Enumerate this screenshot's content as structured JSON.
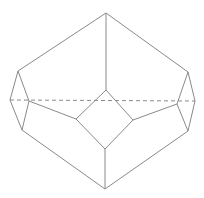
{
  "diagram": {
    "title": "",
    "colors": {
      "stroke": "#8a8a8a",
      "background": "#ffffff"
    },
    "vertices": {
      "top": [
        106,
        13
      ],
      "upper_left": [
        18,
        71
      ],
      "upper_right": [
        188,
        72
      ],
      "far_left": [
        10,
        100
      ],
      "far_right": [
        195,
        101
      ],
      "inner_left": [
        29,
        101
      ],
      "inner_right": [
        177,
        104
      ],
      "lower_left": [
        22,
        130
      ],
      "lower_right": [
        188,
        131
      ],
      "square_top": [
        106,
        90
      ],
      "square_left": [
        76,
        119
      ],
      "square_right": [
        133,
        120
      ],
      "square_bottom": [
        105,
        149
      ],
      "bottom": [
        105,
        189
      ]
    },
    "edges": [
      [
        "top",
        "upper_left"
      ],
      [
        "top",
        "upper_right"
      ],
      [
        "top",
        "square_top"
      ],
      [
        "upper_left",
        "far_left"
      ],
      [
        "upper_left",
        "inner_left"
      ],
      [
        "upper_right",
        "far_right"
      ],
      [
        "upper_right",
        "inner_right"
      ],
      [
        "far_left",
        "lower_left"
      ],
      [
        "inner_left",
        "lower_left"
      ],
      [
        "far_right",
        "lower_right"
      ],
      [
        "inner_right",
        "lower_right"
      ],
      [
        "inner_left",
        "square_left"
      ],
      [
        "inner_right",
        "square_right"
      ],
      [
        "square_top",
        "square_left"
      ],
      [
        "square_top",
        "square_right"
      ],
      [
        "square_left",
        "square_bottom"
      ],
      [
        "square_right",
        "square_bottom"
      ],
      [
        "square_bottom",
        "bottom"
      ],
      [
        "lower_left",
        "bottom"
      ],
      [
        "lower_right",
        "bottom"
      ]
    ],
    "hidden_edges": [
      [
        "far_left",
        "far_right"
      ]
    ]
  }
}
